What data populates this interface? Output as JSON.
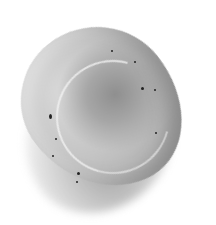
{
  "image": {
    "subject": "polished tumbled stone",
    "background_color": "#ffffff",
    "stone_colors": [
      "#d9d9d9",
      "#c4c4c4",
      "#a6a6a6",
      "#8f8f8f"
    ],
    "speck_color": "#222222"
  }
}
